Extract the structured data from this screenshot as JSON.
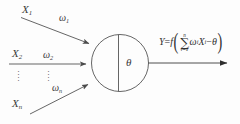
{
  "diagram": {
    "background_color": "#fdfdfd",
    "line_color": "#4a4a4a",
    "text_color": "#303030",
    "inputs": [
      {
        "id": "input-1",
        "variable": "X",
        "variable_subscript": "1",
        "weight": "ω",
        "weight_subscript": "1",
        "connection": "diagonal-down-right"
      },
      {
        "id": "input-2",
        "variable": "X",
        "variable_subscript": "2",
        "weight": "ω",
        "weight_subscript": "2",
        "connection": "horizontal"
      },
      {
        "id": "input-n",
        "variable": "X",
        "variable_subscript": "n",
        "weight": "ω",
        "weight_subscript": "n",
        "connection": "diagonal-up-right"
      }
    ],
    "ellipsis": {
      "glyph": "⋮",
      "columns": [
        {
          "id": "ellipsis-inputs",
          "dots": "···"
        },
        {
          "id": "ellipsis-weights",
          "dots": "···"
        }
      ]
    },
    "neuron": {
      "id": "neuron-body",
      "shape": "circle-with-vertical-divider",
      "threshold_label": "θ"
    },
    "output": {
      "id": "output-signal",
      "arrow": "right",
      "formula_plain": "Y = f( Σ i=1..n ωi Xi − θ )",
      "formula": {
        "lhs": "Y",
        "equals": "=",
        "func": "f",
        "paren_open": "(",
        "sum_symbol": "∑",
        "sum_upper": "n",
        "sum_lower": "i=1",
        "term_weight": "ω",
        "term_weight_sub": "i",
        "term_input": "X",
        "term_input_sub": "i",
        "minus": "−",
        "threshold": "θ",
        "paren_close": ")"
      }
    }
  }
}
